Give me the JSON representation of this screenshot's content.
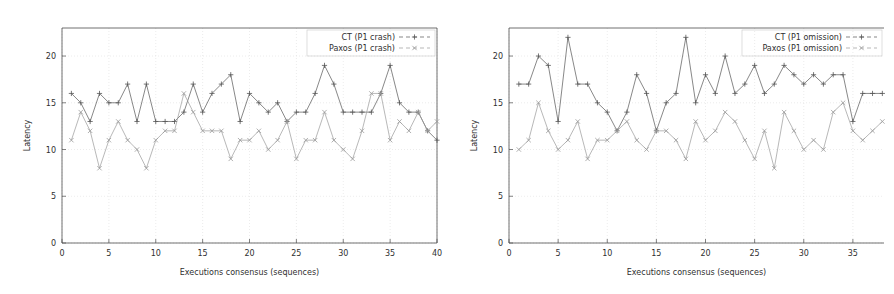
{
  "figure": {
    "background": "#ffffff",
    "panel_count": 2
  },
  "chart_data": [
    {
      "id": "left",
      "type": "line",
      "title": "",
      "xlabel": "Executions consensus (sequences)",
      "ylabel": "Latency",
      "xlim": [
        0,
        40
      ],
      "ylim": [
        0,
        23
      ],
      "xticks": [
        0,
        5,
        10,
        15,
        20,
        25,
        30,
        35,
        40
      ],
      "yticks": [
        0,
        5,
        10,
        15,
        20
      ],
      "grid": true,
      "legend_position": "top-right",
      "clipped_right": false,
      "x": [
        1,
        2,
        3,
        4,
        5,
        6,
        7,
        8,
        9,
        10,
        11,
        12,
        13,
        14,
        15,
        16,
        17,
        18,
        19,
        20,
        21,
        22,
        23,
        24,
        25,
        26,
        27,
        28,
        29,
        30,
        31,
        32,
        33,
        34,
        35,
        36,
        37,
        38,
        39,
        40
      ],
      "series": [
        {
          "name": "CT (P1 crash)",
          "color": "#555555",
          "marker": "plus",
          "values": [
            16,
            15,
            13,
            16,
            15,
            15,
            17,
            13,
            17,
            13,
            13,
            13,
            14,
            17,
            14,
            16,
            17,
            18,
            13,
            16,
            15,
            14,
            15,
            13,
            14,
            14,
            16,
            19,
            17,
            14,
            14,
            14,
            14,
            16,
            19,
            15,
            14,
            14,
            12,
            11
          ]
        },
        {
          "name": "Paxos (P1 crash)",
          "color": "#9a9a9a",
          "marker": "cross",
          "values": [
            11,
            14,
            12,
            8,
            11,
            13,
            11,
            10,
            8,
            11,
            12,
            12,
            16,
            14,
            12,
            12,
            12,
            9,
            11,
            11,
            12,
            10,
            11,
            13,
            9,
            11,
            11,
            14,
            11,
            10,
            9,
            12,
            16,
            16,
            11,
            13,
            12,
            14,
            12,
            13
          ]
        }
      ]
    },
    {
      "id": "right",
      "type": "line",
      "title": "",
      "xlabel": "Executions consensus (sequences)",
      "ylabel": "Latency",
      "xlim": [
        0,
        40
      ],
      "ylim": [
        0,
        23
      ],
      "xticks": [
        0,
        5,
        10,
        15,
        20,
        25,
        30,
        35,
        40
      ],
      "yticks": [
        0,
        5,
        10,
        15,
        20
      ],
      "grid": true,
      "legend_position": "top-right",
      "clipped_right": true,
      "x": [
        1,
        2,
        3,
        4,
        5,
        6,
        7,
        8,
        9,
        10,
        11,
        12,
        13,
        14,
        15,
        16,
        17,
        18,
        19,
        20,
        21,
        22,
        23,
        24,
        25,
        26,
        27,
        28,
        29,
        30,
        31,
        32,
        33,
        34,
        35,
        36,
        37,
        38,
        39,
        40
      ],
      "series": [
        {
          "name": "CT (P1 omission)",
          "color": "#555555",
          "marker": "plus",
          "values": [
            17,
            17,
            20,
            19,
            13,
            22,
            17,
            17,
            15,
            14,
            12,
            14,
            18,
            16,
            12,
            15,
            16,
            22,
            15,
            18,
            16,
            20,
            16,
            17,
            19,
            16,
            17,
            19,
            18,
            17,
            18,
            17,
            18,
            18,
            13,
            16,
            16,
            16,
            17,
            14
          ]
        },
        {
          "name": "Paxos (P1 omission)",
          "color": "#9a9a9a",
          "marker": "cross",
          "values": [
            10,
            11,
            15,
            12,
            10,
            11,
            13,
            9,
            11,
            11,
            12,
            13,
            11,
            10,
            12,
            12,
            11,
            9,
            13,
            11,
            12,
            14,
            13,
            11,
            9,
            12,
            8,
            14,
            12,
            10,
            11,
            10,
            14,
            15,
            12,
            11,
            12,
            13,
            10,
            11
          ]
        }
      ]
    }
  ]
}
